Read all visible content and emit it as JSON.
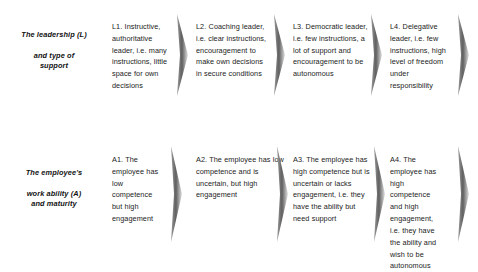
{
  "diagram": {
    "colors": {
      "background": "#ffffff",
      "text": "#1c1c1c",
      "label_text": "#111111",
      "divider_dark": "#6f6f6f",
      "divider_light": "#d8d8d8"
    },
    "rows": [
      {
        "id": "leadership",
        "label_lines": [
          "The leadership (L)",
          "and type of",
          "support"
        ],
        "cells": [
          {
            "id": "L1",
            "text": "L1. Instructive, authoritative leader, i.e. many instructions, little space for own decisions"
          },
          {
            "id": "L2",
            "text": "L2. Coaching leader, i.e. clear instructions, encouragement to make own decisions in secure conditions"
          },
          {
            "id": "L3",
            "text": "L3. Democratic leader, i.e. few instructions, a lot of support and encouragement to be autonomous"
          },
          {
            "id": "L4",
            "text": "L4. Delegative leader, i.e. few instructions, high level of freedom under responsibility"
          }
        ],
        "dividers": [
          "chevron-divider-1",
          "chevron-divider-2",
          "chevron-divider-3",
          "chevron-divider-4"
        ]
      },
      {
        "id": "employee",
        "label_lines": [
          "The employee's",
          "work ability (A)",
          "and maturity"
        ],
        "cells": [
          {
            "id": "A1",
            "text": "A1. The employee has low competence but high engagement"
          },
          {
            "id": "A2",
            "text": "A2. The employee has low competence and is uncertain, but high engagement"
          },
          {
            "id": "A3",
            "text": "A3. The employee has high competence but is uncertain or lacks engagement, i.e. they have the ability but need support"
          },
          {
            "id": "A4",
            "text": "A4. The employee has high competence and high engagement, i.e. they have the ability and wish to be autonomous"
          }
        ],
        "dividers": [
          "chevron-divider-1",
          "chevron-divider-2",
          "chevron-divider-3",
          "chevron-divider-4"
        ]
      }
    ]
  }
}
